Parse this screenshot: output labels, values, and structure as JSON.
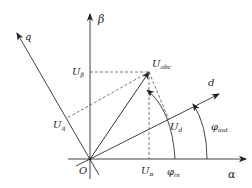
{
  "diagram": {
    "colors": {
      "line": "#333333",
      "dashed": "#555555",
      "background": "#ffffff"
    },
    "axes": {
      "alpha": {
        "label": "α"
      },
      "beta": {
        "label": "β"
      },
      "d": {
        "label": "d"
      },
      "q": {
        "label": "q"
      },
      "origin": {
        "label": "O"
      }
    },
    "vectors": {
      "u_abc": {
        "main": "U",
        "sub": "abc"
      }
    },
    "projections": {
      "u_alpha": {
        "main": "U",
        "sub": "α"
      },
      "u_beta": {
        "main": "U",
        "sub": "β"
      },
      "u_d": {
        "main": "U",
        "sub": "d"
      },
      "u_q": {
        "main": "U",
        "sub": "q"
      }
    },
    "angles": {
      "phi_in": {
        "main": "φ",
        "sub": "in"
      },
      "phi_out": {
        "main": "φ",
        "sub": "out"
      }
    }
  }
}
